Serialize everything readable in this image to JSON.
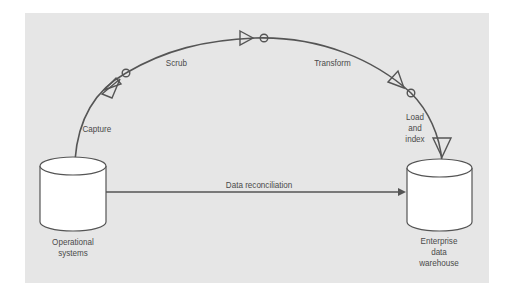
{
  "diagram": {
    "type": "data-flow",
    "colors": {
      "panel_background": "#e6e6e6",
      "line": "#555555",
      "cylinder_fill": "#ffffff",
      "text": "#4a4a4a"
    },
    "nodes": {
      "source": {
        "label": "Operational\nsystems",
        "shape": "cylinder-icon"
      },
      "target": {
        "label": "Enterprise\ndata\nwarehouse",
        "shape": "cylinder-icon"
      }
    },
    "pipeline_steps": [
      {
        "label": "Capture"
      },
      {
        "label": "Scrub"
      },
      {
        "label": "Transform"
      },
      {
        "label": "Load\nand\nindex"
      }
    ],
    "direct_link": {
      "label": "Data reconciliation"
    }
  }
}
